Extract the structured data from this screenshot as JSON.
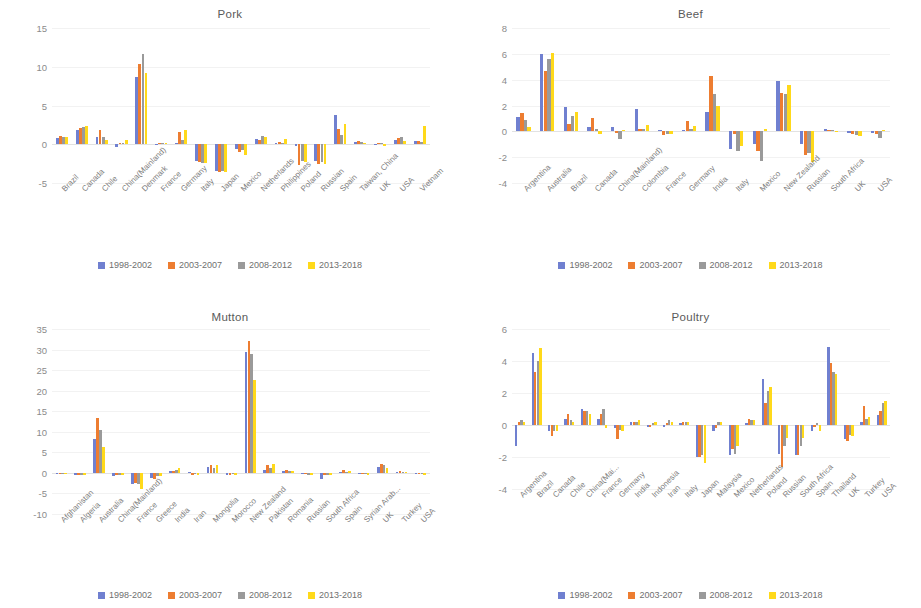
{
  "colors": {
    "s1": "#7080d0",
    "s2": "#ed7d31",
    "s3": "#9a9a9a",
    "s4": "#ffd91a",
    "grid": "#f2f2f2",
    "axis_text": "#8b8b8b",
    "title_text": "#5a5a5a"
  },
  "legend": {
    "items": [
      {
        "label": "1998-2002",
        "color": "#7080d0"
      },
      {
        "label": "2003-2007",
        "color": "#ed7d31"
      },
      {
        "label": "2008-2012",
        "color": "#9a9a9a"
      },
      {
        "label": "2013-2018",
        "color": "#ffd91a"
      }
    ]
  },
  "chart_data": [
    {
      "id": "pork",
      "type": "bar",
      "title": "Pork",
      "xlabel": "",
      "ylabel": "",
      "ylim": [
        -5,
        15
      ],
      "yticks": [
        -5,
        0,
        5,
        10,
        15
      ],
      "ticklabels": [
        "-5",
        "0",
        "5",
        "10",
        "15"
      ],
      "grid": true,
      "legend_position": "bottom",
      "categories": [
        "Brazil",
        "Canada",
        "Chile",
        "China(Mainland)",
        "Denmark",
        "France",
        "Germany",
        "Italy",
        "Japan",
        "Mexico",
        "Netherlands",
        "Philippines",
        "Poland",
        "Russian",
        "Spain",
        "Taiwan, China",
        "UK",
        "USA",
        "Vietnam"
      ],
      "series": [
        {
          "name": "1998-2002",
          "color": "#7080d0",
          "values": [
            0.8,
            1.9,
            1.0,
            -0.3,
            8.7,
            -0.1,
            0.2,
            -2.2,
            -3.5,
            -0.6,
            0.7,
            0.1,
            -0.2,
            -2.2,
            3.8,
            0.3,
            -0.1,
            0.5,
            0.4
          ]
        },
        {
          "name": "2003-2007",
          "color": "#ed7d31",
          "values": [
            1.1,
            2.1,
            1.9,
            0.1,
            10.3,
            0.1,
            1.6,
            -2.3,
            -3.6,
            -1.0,
            0.6,
            0.3,
            -2.7,
            -2.5,
            2.0,
            0.4,
            0.1,
            0.8,
            0.4
          ]
        },
        {
          "name": "2008-2012",
          "color": "#9a9a9a",
          "values": [
            1.0,
            2.2,
            1.0,
            0.2,
            11.6,
            0.2,
            0.5,
            -2.4,
            -3.5,
            -0.8,
            1.1,
            0.2,
            -2.2,
            -2.3,
            1.2,
            0.3,
            0.2,
            0.9,
            0.3
          ]
        },
        {
          "name": "2013-2018",
          "color": "#ffd91a",
          "values": [
            0.9,
            2.3,
            0.5,
            0.5,
            9.2,
            0.1,
            1.8,
            -2.4,
            -3.6,
            -1.4,
            0.9,
            0.7,
            -2.3,
            -2.6,
            2.6,
            0.2,
            -0.2,
            0.4,
            2.3
          ]
        }
      ]
    },
    {
      "id": "beef",
      "type": "bar",
      "title": "Beef",
      "xlabel": "",
      "ylabel": "",
      "ylim": [
        -4,
        8
      ],
      "yticks": [
        -4,
        -2,
        0,
        2,
        4,
        6,
        8
      ],
      "ticklabels": [
        "-4",
        "-2",
        "0",
        "2",
        "4",
        "6",
        "8"
      ],
      "grid": true,
      "legend_position": "bottom",
      "categories": [
        "Argentina",
        "Australia",
        "Brazil",
        "Canada",
        "China(Mainland)",
        "Colombia",
        "France",
        "Germany",
        "India",
        "Italy",
        "Mexico",
        "New Zealand",
        "Russian",
        "South Africa",
        "UK",
        "USA"
      ],
      "series": [
        {
          "name": "1998-2002",
          "color": "#7080d0",
          "values": [
            1.1,
            6.0,
            1.9,
            0.3,
            0.3,
            1.7,
            0.1,
            0.1,
            1.5,
            -1.4,
            -1.0,
            3.9,
            -1.0,
            0.2,
            -0.1,
            -0.1
          ]
        },
        {
          "name": "2003-2007",
          "color": "#ed7d31",
          "values": [
            1.4,
            4.7,
            0.6,
            1.0,
            -0.1,
            0.2,
            -0.3,
            0.8,
            4.3,
            -0.2,
            -1.5,
            3.0,
            -1.8,
            0.1,
            -0.2,
            -0.2
          ]
        },
        {
          "name": "2008-2012",
          "color": "#9a9a9a",
          "values": [
            0.9,
            5.6,
            1.2,
            0.2,
            -0.6,
            0.2,
            -0.2,
            0.2,
            2.9,
            -1.5,
            -2.3,
            2.9,
            -1.7,
            0.1,
            -0.3,
            -0.5
          ]
        },
        {
          "name": "2013-2018",
          "color": "#ffd91a",
          "values": [
            0.3,
            6.1,
            1.5,
            -0.2,
            0.1,
            0.5,
            -0.2,
            0.4,
            2.0,
            -1.1,
            0.2,
            3.6,
            -2.4,
            0.0,
            -0.4,
            0.1
          ]
        }
      ]
    },
    {
      "id": "mutton",
      "type": "bar",
      "title": "Mutton",
      "xlabel": "",
      "ylabel": "",
      "ylim": [
        -10,
        35
      ],
      "yticks": [
        -10,
        -5,
        0,
        5,
        10,
        15,
        20,
        25,
        30,
        35
      ],
      "ticklabels": [
        "-10",
        "-5",
        "0",
        "5",
        "10",
        "15",
        "20",
        "25",
        "30",
        "35"
      ],
      "grid": true,
      "legend_position": "bottom",
      "categories": [
        "Afghanistan",
        "Algeria",
        "Australia",
        "China(Mainland)",
        "France",
        "Greece",
        "India",
        "Iran",
        "Mongolia",
        "Morocco",
        "New Zealand",
        "Pakistan",
        "Romania",
        "Russian",
        "South Africa",
        "Spain",
        "Syrian Arab...",
        "UK",
        "Turkey",
        "USA"
      ],
      "series": [
        {
          "name": "1998-2002",
          "color": "#7080d0",
          "values": [
            -0.2,
            -0.5,
            8.2,
            -0.8,
            -2.8,
            -1.2,
            0.4,
            0.3,
            1.5,
            -0.4,
            29.5,
            0.6,
            0.5,
            -0.3,
            -1.5,
            0.3,
            -0.3,
            1.5,
            0.2,
            -0.3
          ]
        },
        {
          "name": "2003-2007",
          "color": "#ed7d31",
          "values": [
            -0.2,
            -0.4,
            13.3,
            -0.5,
            -2.5,
            -1.6,
            0.5,
            -0.4,
            1.8,
            -0.4,
            32.0,
            2.0,
            0.6,
            -0.3,
            -0.6,
            0.6,
            -0.3,
            2.1,
            0.4,
            -0.3
          ]
        },
        {
          "name": "2008-2012",
          "color": "#9a9a9a",
          "values": [
            -0.2,
            -0.4,
            10.4,
            -0.5,
            -2.7,
            -0.8,
            0.7,
            -0.3,
            1.3,
            -0.3,
            28.8,
            1.2,
            0.5,
            -0.4,
            -0.5,
            0.3,
            -0.3,
            2.0,
            0.3,
            -0.3
          ]
        },
        {
          "name": "2013-2018",
          "color": "#ffd91a",
          "values": [
            -0.2,
            -0.5,
            6.4,
            -0.6,
            -4.0,
            -0.8,
            1.1,
            -0.4,
            2.0,
            -0.4,
            22.5,
            2.1,
            0.4,
            -0.4,
            -0.5,
            0.4,
            -0.4,
            1.2,
            0.3,
            -0.4
          ]
        }
      ]
    },
    {
      "id": "poultry",
      "type": "bar",
      "title": "Poultry",
      "xlabel": "",
      "ylabel": "",
      "ylim": [
        -4,
        6
      ],
      "yticks": [
        -4,
        -2,
        0,
        2,
        4,
        6
      ],
      "ticklabels": [
        "-4",
        "-2",
        "0",
        "2",
        "4",
        "6"
      ],
      "grid": true,
      "legend_position": "bottom",
      "categories": [
        "Argentina",
        "Brazil",
        "Canada",
        "Chile",
        "China(Mai...",
        "France",
        "Germany",
        "India",
        "Indonesia",
        "Iran",
        "Italy",
        "Japan",
        "Malaysia",
        "Mexico",
        "Netherlands",
        "Poland",
        "Russian",
        "South Africa",
        "Spain",
        "Thailand",
        "UK",
        "Turkey",
        "USA"
      ],
      "series": [
        {
          "name": "1998-2002",
          "color": "#7080d0",
          "values": [
            -1.3,
            4.5,
            -0.4,
            0.4,
            1.0,
            0.4,
            -0.2,
            0.2,
            -0.1,
            -0.1,
            0.1,
            -2.0,
            -0.4,
            -1.9,
            0.1,
            2.9,
            -1.8,
            -1.9,
            -0.4,
            4.9,
            -0.9,
            0.2,
            0.6
          ]
        },
        {
          "name": "2003-2007",
          "color": "#ed7d31",
          "values": [
            0.2,
            3.3,
            -0.7,
            0.7,
            0.9,
            0.7,
            -0.9,
            0.2,
            -0.1,
            0.1,
            0.2,
            -2.0,
            -0.2,
            -1.5,
            0.4,
            1.4,
            -2.6,
            -1.9,
            -0.1,
            3.9,
            -1.0,
            1.2,
            0.9
          ]
        },
        {
          "name": "2008-2012",
          "color": "#9a9a9a",
          "values": [
            0.3,
            4.0,
            -0.4,
            0.3,
            0.9,
            1.0,
            -0.3,
            0.2,
            0.1,
            0.3,
            0.2,
            -1.9,
            0.2,
            -1.8,
            0.3,
            2.1,
            -1.3,
            -1.3,
            0.1,
            3.3,
            -0.6,
            0.4,
            1.4
          ]
        },
        {
          "name": "2013-2018",
          "color": "#ffd91a",
          "values": [
            0.2,
            4.8,
            -0.4,
            0.2,
            0.7,
            -0.2,
            -0.4,
            0.3,
            0.2,
            0.2,
            0.2,
            -2.4,
            0.2,
            -1.3,
            0.3,
            2.4,
            -0.8,
            -0.8,
            -0.4,
            3.2,
            -0.7,
            0.5,
            1.5
          ]
        }
      ]
    }
  ]
}
